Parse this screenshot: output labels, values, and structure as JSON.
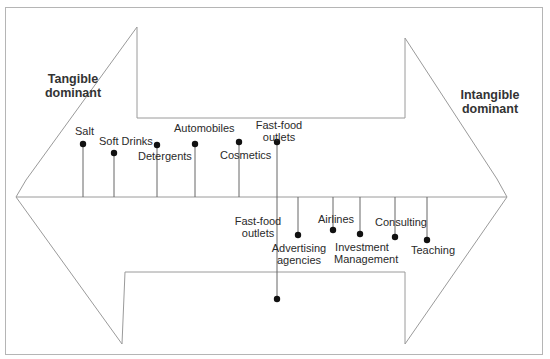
{
  "diagram": {
    "type": "tangible-intangible continuum",
    "left_heading": {
      "line1": "Tangible",
      "line2": "dominant"
    },
    "right_heading": {
      "line1": "Intangible",
      "line2": "dominant"
    },
    "top_items": [
      {
        "label": "Salt"
      },
      {
        "label": "Soft Drinks"
      },
      {
        "label": "Detergents"
      },
      {
        "label": "Automobiles"
      },
      {
        "label": "Cosmetics"
      },
      {
        "label_line1": "Fast-food",
        "label_line2": "outlets"
      }
    ],
    "bottom_items": [
      {
        "label_line1": "Fast-food",
        "label_line2": "outlets"
      },
      {
        "label_line1": "Advertising",
        "label_line2": "agencies"
      },
      {
        "label": "Airlines"
      },
      {
        "label_line1": "Investment",
        "label_line2": "Management"
      },
      {
        "label": "Consulting"
      },
      {
        "label": "Teaching"
      }
    ],
    "colors": {
      "line": "#9a9a9a",
      "dot": "#111111",
      "text": "#2a2a2a"
    }
  }
}
